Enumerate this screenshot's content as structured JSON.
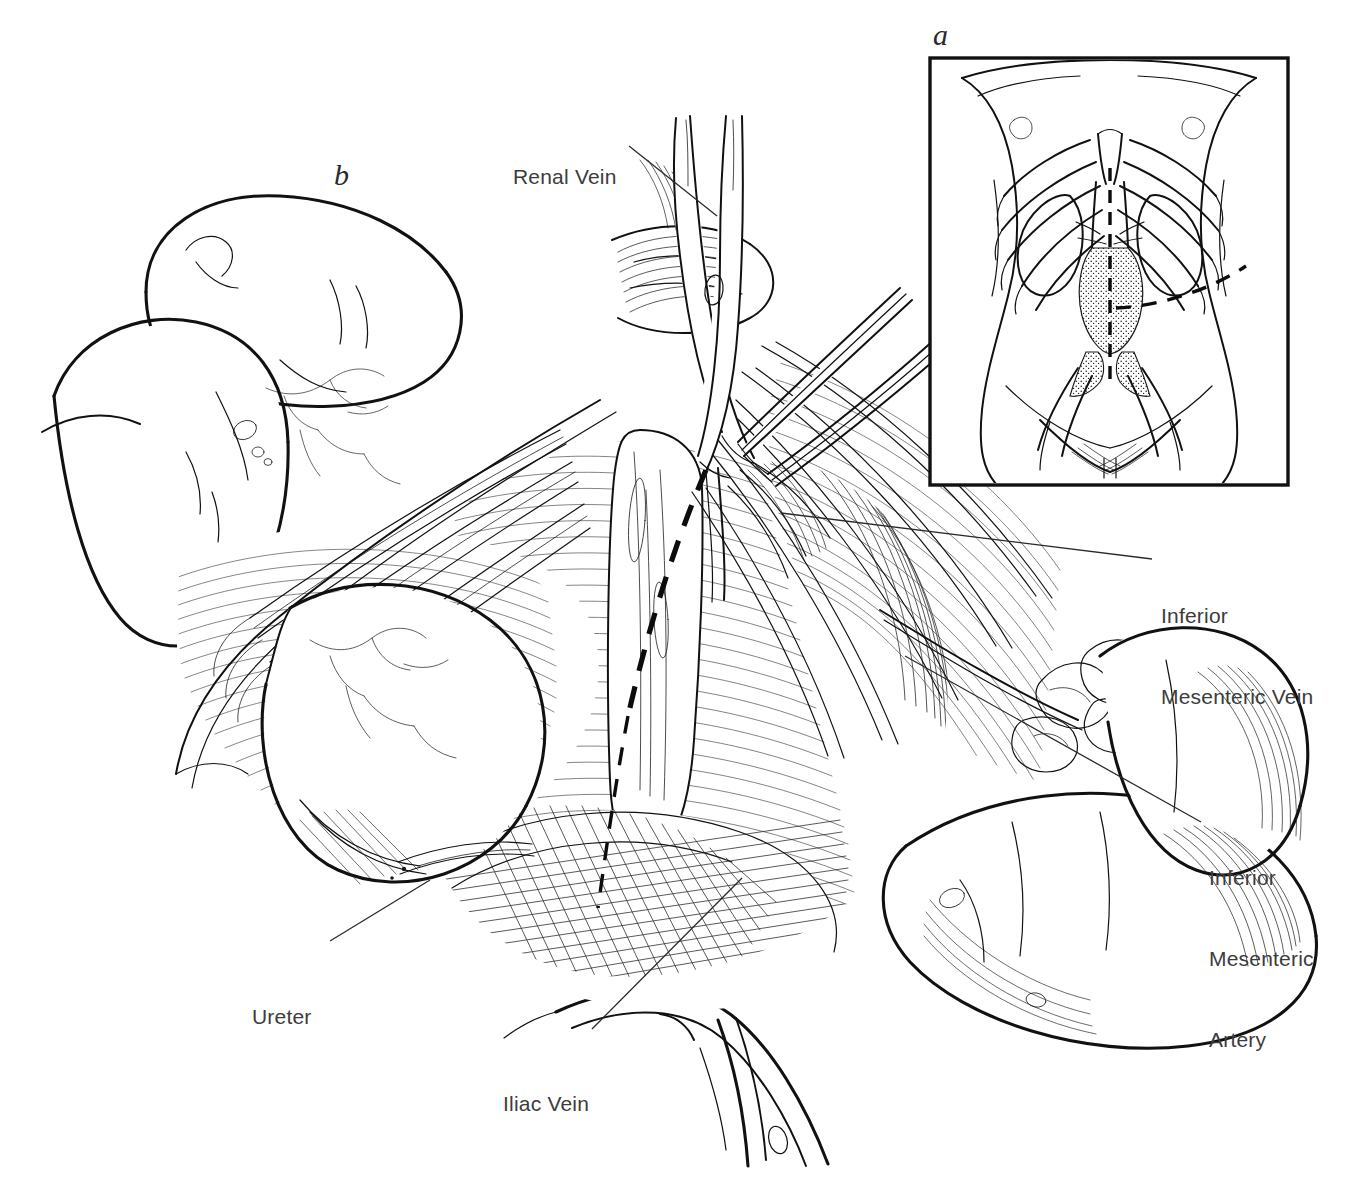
{
  "figure": {
    "domain": "medical-illustration",
    "background_color": "#ffffff",
    "ink_color": "#111111",
    "label_color": "#3c3c3c",
    "width": 1345,
    "height": 1194
  },
  "panels": [
    {
      "id": "a",
      "letter": "a",
      "name": "inset-orientation-panel",
      "caption": "Torso with ribcage, kidneys, stippled aortic aneurysm, iliac vessels and dashed incision lines",
      "frame": {
        "x": 930,
        "y": 58,
        "width": 358,
        "height": 427
      }
    },
    {
      "id": "b",
      "letter": "b",
      "name": "main-operative-field-panel",
      "caption": "Operative field: bowel retracted left and right, retroperitoneum opened along dashed line"
    }
  ],
  "labels": [
    {
      "id": "renal-vein",
      "text": "Renal Vein",
      "lines": [
        "Renal Vein"
      ],
      "x": 513,
      "y": 109,
      "align": "left",
      "leader": {
        "from": [
          629,
          146
        ],
        "to": [
          717,
          216
        ]
      }
    },
    {
      "id": "inferior-mesenteric-vein",
      "text": "Inferior Mesenteric Vein",
      "lines": [
        "Inferior",
        "Mesenteric Vein"
      ],
      "x": 1161,
      "y": 548,
      "align": "left",
      "leader": {
        "from": [
          1152,
          559
        ],
        "to": [
          781,
          513
        ]
      }
    },
    {
      "id": "inferior-mesenteric-artery",
      "text": "Inferior Mesenteric Artery",
      "lines": [
        "Inferior",
        "Mesenteric",
        "Artery"
      ],
      "x": 1209,
      "y": 810,
      "align": "left",
      "leader": {
        "from": [
          1201,
          822
        ],
        "to": [
          905,
          656
        ]
      }
    },
    {
      "id": "ureter",
      "text": "Ureter",
      "lines": [
        "Ureter"
      ],
      "x": 252,
      "y": 949,
      "align": "left",
      "leader": {
        "from": [
          330,
          941
        ],
        "to": [
          430,
          880
        ]
      }
    },
    {
      "id": "iliac-vein",
      "text": "Iliac Vein",
      "lines": [
        "Iliac Vein"
      ],
      "x": 503,
      "y": 1036,
      "align": "left",
      "leader": {
        "from": [
          592,
          1029
        ],
        "to": [
          742,
          878
        ]
      }
    }
  ],
  "instruments": [
    {
      "id": "scissors",
      "name": "surgical-scissors",
      "note": "crossed blades with hinge pin, entering from top, tip at peritoneum"
    },
    {
      "id": "forceps",
      "name": "surgical-forceps",
      "note": "fine forceps entering from upper right, tip meeting scissors"
    }
  ],
  "anatomy": [
    {
      "id": "colon-left",
      "name": "retracted-colon-left"
    },
    {
      "id": "small-bowel",
      "name": "small-bowel-loops"
    },
    {
      "id": "sigmoid-colon",
      "name": "sigmoid-colon-right"
    },
    {
      "id": "mesentery",
      "name": "mesentery-with-vessels"
    },
    {
      "id": "retroperitoneum",
      "name": "retroperitoneal-tissue"
    },
    {
      "id": "aorta",
      "name": "abdominal-aorta"
    },
    {
      "id": "iliac-vessels",
      "name": "iliac-vessels"
    },
    {
      "id": "ureter-structure",
      "name": "ureter"
    }
  ],
  "inset_anatomy": [
    {
      "id": "torso",
      "name": "torso-outline"
    },
    {
      "id": "ribcage",
      "name": "ribcage"
    },
    {
      "id": "kidneys",
      "name": "kidneys"
    },
    {
      "id": "aneurysm",
      "name": "aortic-aneurysm-stippled"
    },
    {
      "id": "iliacs",
      "name": "iliac-arteries"
    },
    {
      "id": "midline-incision",
      "name": "midline-incision-dashed"
    },
    {
      "id": "transverse-incision",
      "name": "transverse-incision-dashed"
    }
  ]
}
